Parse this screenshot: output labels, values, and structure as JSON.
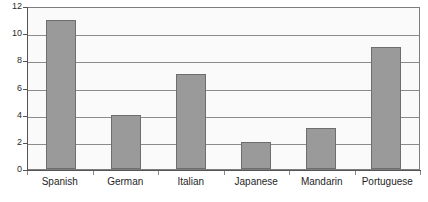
{
  "chart_data": {
    "type": "bar",
    "title": "",
    "xlabel": "",
    "ylabel": "",
    "categories": [
      "Spanish",
      "German",
      "Italian",
      "Japanese",
      "Mandarin",
      "Portuguese"
    ],
    "values": [
      11,
      4,
      7,
      2,
      3,
      9
    ],
    "ylim": [
      0,
      12
    ],
    "ytick_labels": [
      "12",
      "10",
      "8",
      "6",
      "4",
      "2",
      "0"
    ],
    "ytick_values": [
      12,
      10,
      8,
      6,
      4,
      2,
      0
    ],
    "grid": true,
    "legend": "none",
    "colors": {
      "bar_fill": "#9a9a9a",
      "bar_border": "#6e6e6e",
      "plot_background": "#fafafa",
      "gridline": "#8c8c8c",
      "axis": "#555555",
      "text": "#1f1f1f"
    }
  }
}
